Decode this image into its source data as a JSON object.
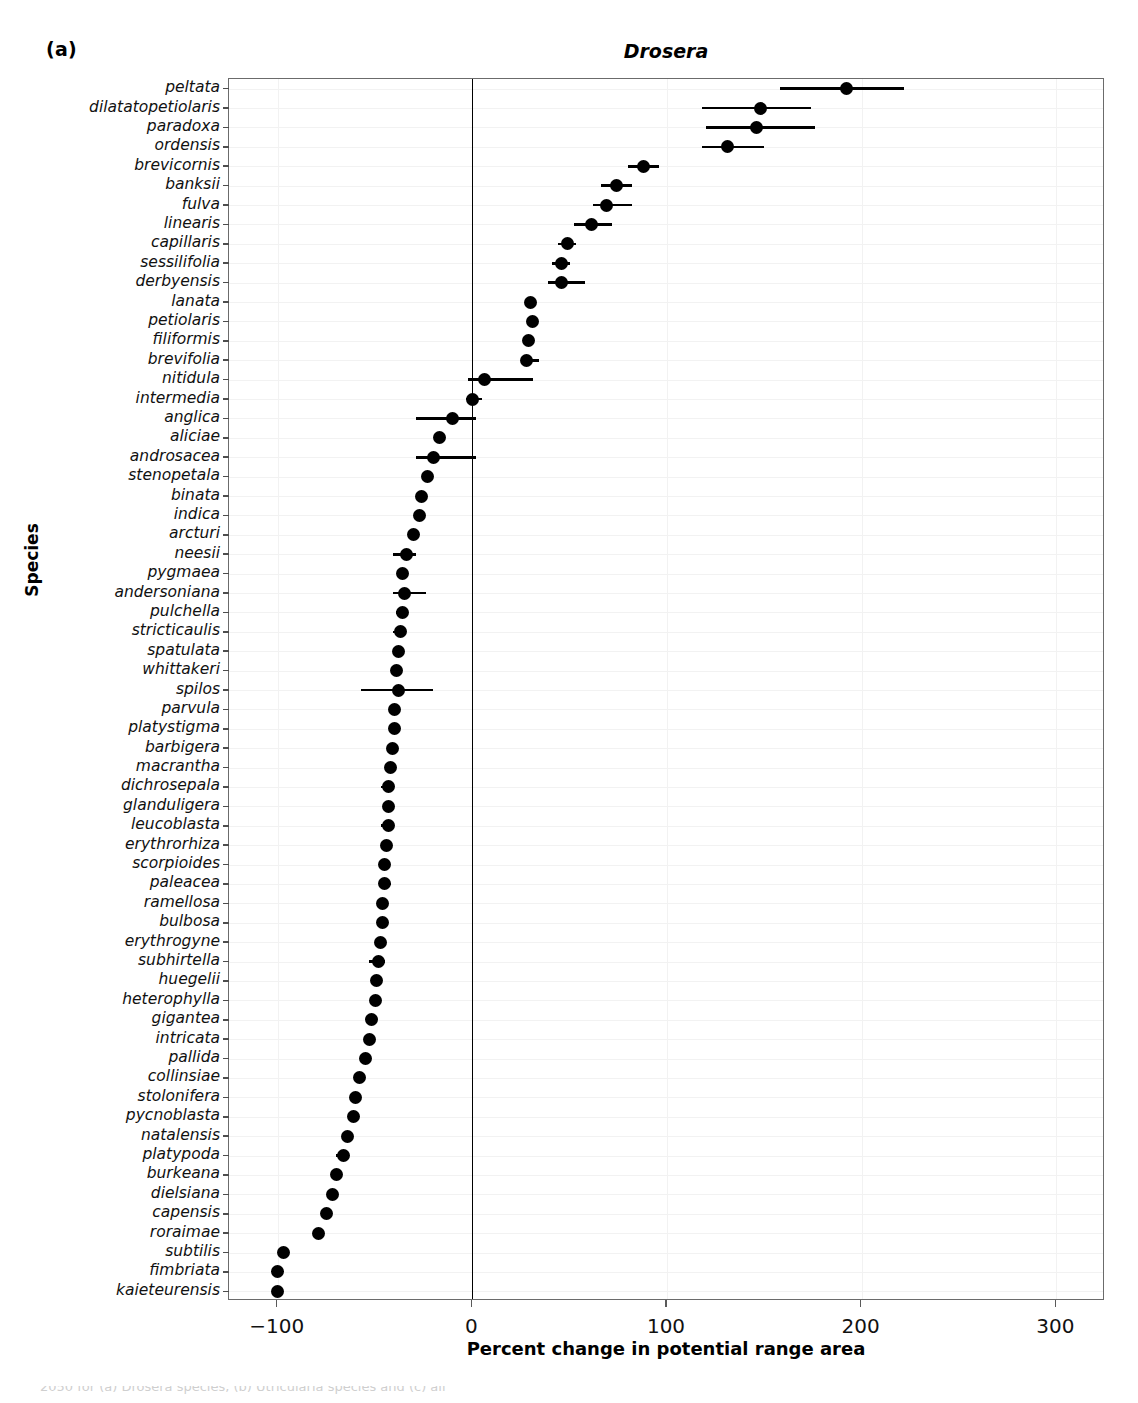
{
  "panel_label": "(a)",
  "yaxis_title": "Species",
  "xaxis_title": "Percent change in potential range area",
  "caption_partial": "2050 for (a) Drosera species, (b) Utricularia species and (c) all",
  "colors": {
    "point": "#000000",
    "error_bar": "#000000",
    "zero_line": "#000000",
    "panel_border": "#6b6b6b",
    "grid": "#f2f2f2"
  },
  "chart_data": {
    "type": "scatter",
    "title": "Drosera",
    "xlabel": "Percent change in potential range area",
    "ylabel": "Species",
    "xlim": [
      -125,
      325
    ],
    "xticks": [
      -100,
      0,
      100,
      200,
      300
    ],
    "xtick_labels": [
      "−100",
      "0",
      "100",
      "200",
      "300"
    ],
    "grid": true,
    "legend": null,
    "zero_reference_line": 0,
    "orientation": "horizontal",
    "error_bar_type": "range",
    "categories": [
      "peltata",
      "dilatatopetiolaris",
      "paradoxa",
      "ordensis",
      "brevicornis",
      "banksii",
      "fulva",
      "linearis",
      "capillaris",
      "sessilifolia",
      "derbyensis",
      "lanata",
      "petiolaris",
      "filiformis",
      "brevifolia",
      "nitidula",
      "intermedia",
      "anglica",
      "aliciae",
      "androsacea",
      "stenopetala",
      "binata",
      "indica",
      "arcturi",
      "neesii",
      "pygmaea",
      "andersoniana",
      "pulchella",
      "stricticaulis",
      "spatulata",
      "whittakeri",
      "spilos",
      "parvula",
      "platystigma",
      "barbigera",
      "macrantha",
      "dichrosepala",
      "glanduligera",
      "leucoblasta",
      "erythrorhiza",
      "scorpioides",
      "paleacea",
      "ramellosa",
      "bulbosa",
      "erythrogyne",
      "subhirtella",
      "huegelii",
      "heterophylla",
      "gigantea",
      "intricata",
      "pallida",
      "collinsiae",
      "stolonifera",
      "pycnoblasta",
      "natalensis",
      "platypoda",
      "burkeana",
      "dielsiana",
      "capensis",
      "roraimae",
      "subtilis",
      "fimbriata",
      "kaieteurensis"
    ],
    "series": [
      {
        "name": "Percent change in potential range area (2050)",
        "points": [
          {
            "species": "peltata",
            "value": 192,
            "low": 158,
            "high": 222
          },
          {
            "species": "dilatatopetiolaris",
            "value": 148,
            "low": 118,
            "high": 174
          },
          {
            "species": "paradoxa",
            "value": 146,
            "low": 120,
            "high": 176
          },
          {
            "species": "ordensis",
            "value": 131,
            "low": 118,
            "high": 150
          },
          {
            "species": "brevicornis",
            "value": 88,
            "low": 80,
            "high": 96
          },
          {
            "species": "banksii",
            "value": 74,
            "low": 66,
            "high": 82
          },
          {
            "species": "fulva",
            "value": 69,
            "low": 62,
            "high": 82
          },
          {
            "species": "linearis",
            "value": 61,
            "low": 52,
            "high": 72
          },
          {
            "species": "capillaris",
            "value": 49,
            "low": 44,
            "high": 53
          },
          {
            "species": "sessilifolia",
            "value": 46,
            "low": 41,
            "high": 50
          },
          {
            "species": "derbyensis",
            "value": 46,
            "low": 39,
            "high": 58
          },
          {
            "species": "lanata",
            "value": 30,
            "low": 28,
            "high": 32
          },
          {
            "species": "petiolaris",
            "value": 31,
            "low": 28,
            "high": 33
          },
          {
            "species": "filiformis",
            "value": 29,
            "low": 27,
            "high": 31
          },
          {
            "species": "brevifolia",
            "value": 28,
            "low": 26,
            "high": 34
          },
          {
            "species": "nitidula",
            "value": 6,
            "low": -2,
            "high": 31
          },
          {
            "species": "intermedia",
            "value": 0,
            "low": -3,
            "high": 5
          },
          {
            "species": "anglica",
            "value": -10,
            "low": -29,
            "high": 2
          },
          {
            "species": "aliciae",
            "value": -17,
            "low": -18,
            "high": -15
          },
          {
            "species": "androsacea",
            "value": -20,
            "low": -29,
            "high": 2
          },
          {
            "species": "stenopetala",
            "value": -23,
            "low": -25,
            "high": -21
          },
          {
            "species": "binata",
            "value": -26,
            "low": -28,
            "high": -24
          },
          {
            "species": "indica",
            "value": -27,
            "low": -29,
            "high": -25
          },
          {
            "species": "arcturi",
            "value": -30,
            "low": -32,
            "high": -28
          },
          {
            "species": "neesii",
            "value": -34,
            "low": -41,
            "high": -29
          },
          {
            "species": "pygmaea",
            "value": -36,
            "low": -38,
            "high": -34
          },
          {
            "species": "andersoniana",
            "value": -35,
            "low": -41,
            "high": -24
          },
          {
            "species": "pulchella",
            "value": -36,
            "low": -39,
            "high": -34
          },
          {
            "species": "stricticaulis",
            "value": -37,
            "low": -41,
            "high": -35
          },
          {
            "species": "spatulata",
            "value": -38,
            "low": -40,
            "high": -36
          },
          {
            "species": "whittakeri",
            "value": -39,
            "low": -41,
            "high": -36
          },
          {
            "species": "spilos",
            "value": -38,
            "low": -57,
            "high": -20
          },
          {
            "species": "parvula",
            "value": -40,
            "low": -42,
            "high": -38
          },
          {
            "species": "platystigma",
            "value": -40,
            "low": -42,
            "high": -38
          },
          {
            "species": "barbigera",
            "value": -41,
            "low": -43,
            "high": -39
          },
          {
            "species": "macrantha",
            "value": -42,
            "low": -44,
            "high": -40
          },
          {
            "species": "dichrosepala",
            "value": -43,
            "low": -47,
            "high": -40
          },
          {
            "species": "glanduligera",
            "value": -43,
            "low": -45,
            "high": -41
          },
          {
            "species": "leucoblasta",
            "value": -43,
            "low": -47,
            "high": -41
          },
          {
            "species": "erythrorhiza",
            "value": -44,
            "low": -47,
            "high": -42
          },
          {
            "species": "scorpioides",
            "value": -45,
            "low": -47,
            "high": -43
          },
          {
            "species": "paleacea",
            "value": -45,
            "low": -48,
            "high": -42
          },
          {
            "species": "ramellosa",
            "value": -46,
            "low": -48,
            "high": -44
          },
          {
            "species": "bulbosa",
            "value": -46,
            "low": -49,
            "high": -44
          },
          {
            "species": "erythrogyne",
            "value": -47,
            "low": -49,
            "high": -45
          },
          {
            "species": "subhirtella",
            "value": -48,
            "low": -53,
            "high": -45
          },
          {
            "species": "huegelii",
            "value": -49,
            "low": -51,
            "high": -47
          },
          {
            "species": "heterophylla",
            "value": -50,
            "low": -52,
            "high": -48
          },
          {
            "species": "gigantea",
            "value": -52,
            "low": -54,
            "high": -50
          },
          {
            "species": "intricata",
            "value": -53,
            "low": -55,
            "high": -51
          },
          {
            "species": "pallida",
            "value": -55,
            "low": -57,
            "high": -53
          },
          {
            "species": "collinsiae",
            "value": -58,
            "low": -61,
            "high": -55
          },
          {
            "species": "stolonifera",
            "value": -60,
            "low": -63,
            "high": -58
          },
          {
            "species": "pycnoblasta",
            "value": -61,
            "low": -63,
            "high": -59
          },
          {
            "species": "natalensis",
            "value": -64,
            "low": -66,
            "high": -62
          },
          {
            "species": "platypoda",
            "value": -66,
            "low": -70,
            "high": -64
          },
          {
            "species": "burkeana",
            "value": -70,
            "low": -72,
            "high": -68
          },
          {
            "species": "dielsiana",
            "value": -72,
            "low": -74,
            "high": -70
          },
          {
            "species": "capensis",
            "value": -75,
            "low": -77,
            "high": -73
          },
          {
            "species": "roraimae",
            "value": -79,
            "low": -81,
            "high": -77
          },
          {
            "species": "subtilis",
            "value": -97,
            "low": -99,
            "high": -95
          },
          {
            "species": "fimbriata",
            "value": -100,
            "low": -102,
            "high": -98
          },
          {
            "species": "kaieteurensis",
            "value": -100,
            "low": -102,
            "high": -98
          }
        ]
      }
    ]
  }
}
